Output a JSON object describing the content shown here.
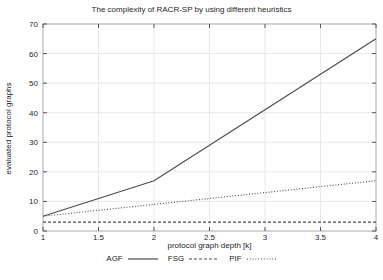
{
  "chart_data": {
    "type": "line",
    "title": "The complexity of RACR-SP by using different heuristics",
    "xlabel": "protocol graph depth [k]",
    "ylabel": "evaluated protocol graphs",
    "x": [
      1,
      2,
      3,
      4
    ],
    "series": [
      {
        "name": "AGF",
        "style": "solid",
        "values": [
          5,
          17,
          41,
          65
        ]
      },
      {
        "name": "FSG",
        "style": "dashed",
        "values": [
          3,
          3,
          3,
          3
        ]
      },
      {
        "name": "PIF",
        "style": "dotted",
        "values": [
          5,
          9,
          13,
          17
        ]
      }
    ],
    "xlim": [
      1,
      4
    ],
    "ylim": [
      0,
      70
    ],
    "xticks": [
      1,
      1.5,
      2,
      2.5,
      3,
      3.5,
      4
    ],
    "xtick_labels": [
      "1",
      "1.5",
      "2",
      "2.5",
      "3",
      "3.5",
      "4"
    ],
    "yticks": [
      0,
      10,
      20,
      30,
      40,
      50,
      60,
      70
    ],
    "ytick_labels": [
      "0",
      "10",
      "20",
      "30",
      "40",
      "50",
      "60",
      "70"
    ],
    "grid": true,
    "legend_position": "bottom",
    "colors": {
      "line": "#4d4d4d",
      "grid": "#e9e9e9",
      "border": "#aaaaaa",
      "tick": "#555555",
      "text": "#262626",
      "background": "#ffffff"
    }
  },
  "legend": {
    "items": [
      {
        "label": "AGF",
        "style": "solid"
      },
      {
        "label": "FSG",
        "style": "dashed"
      },
      {
        "label": "PIF",
        "style": "dotted"
      }
    ]
  }
}
